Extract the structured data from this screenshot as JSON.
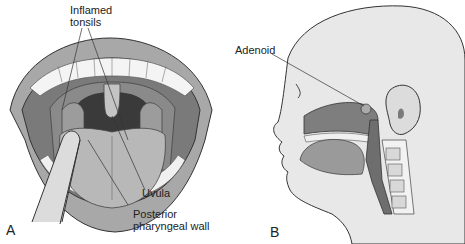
{
  "figure": {
    "panels": [
      {
        "id": "A",
        "letter": "A",
        "view": "open mouth, frontal",
        "labels": {
          "inflamed_tonsils_line1": "Inflamed",
          "inflamed_tonsils_line2": "tonsils",
          "uvula": "Uvula",
          "posterior_line1": "Posterior",
          "posterior_line2": "pharyngeal wall"
        }
      },
      {
        "id": "B",
        "letter": "B",
        "view": "sagittal head section",
        "labels": {
          "adenoid": "Adenoid"
        }
      }
    ]
  },
  "colors": {
    "skin": "#e8e8e8",
    "lips": "#9a9a9a",
    "teeth": "#f4f4f4",
    "mouth_interior": "#7a7a7a",
    "pharynx_dark": "#3a3a3a",
    "tongue": "#b8b8b8",
    "depressor": "#d8d8d8",
    "outline": "#333333",
    "airway": "#6e6e6e",
    "background": "#ffffff"
  }
}
